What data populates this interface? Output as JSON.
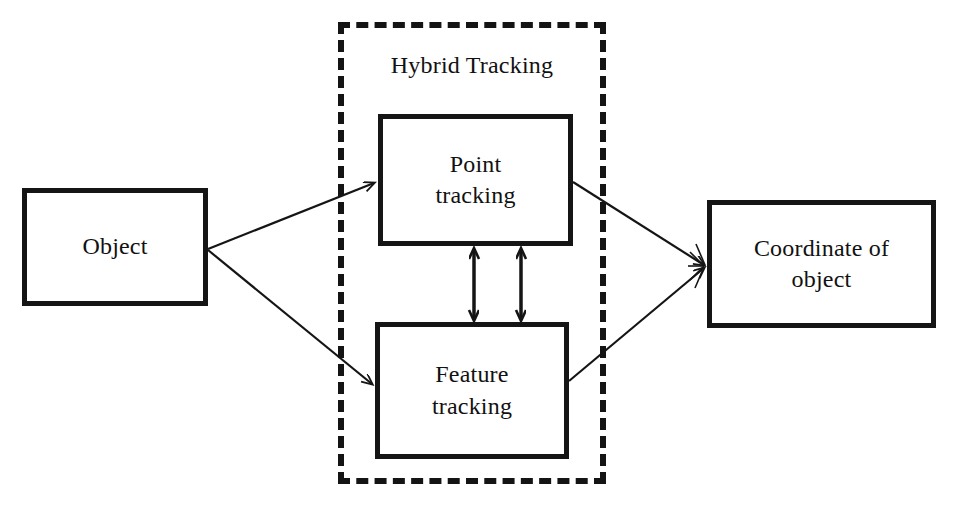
{
  "diagram": {
    "title": "Hybrid Tracking",
    "group": {
      "label": "Hybrid Tracking",
      "style": "dashed",
      "color": "#141414"
    },
    "nodes": [
      {
        "id": "object",
        "label": "Object"
      },
      {
        "id": "point",
        "label": "Point\ntracking"
      },
      {
        "id": "feature",
        "label": "Feature\ntracking"
      },
      {
        "id": "coordinate",
        "label": "Coordinate of\nobject"
      }
    ],
    "edges": [
      {
        "from": "object",
        "to": "point",
        "arrow": "single"
      },
      {
        "from": "object",
        "to": "feature",
        "arrow": "single"
      },
      {
        "from": "point",
        "to": "coordinate",
        "arrow": "single"
      },
      {
        "from": "feature",
        "to": "coordinate",
        "arrow": "single"
      },
      {
        "from": "point",
        "to": "feature",
        "arrow": "double"
      },
      {
        "from": "feature",
        "to": "point",
        "arrow": "double"
      }
    ],
    "colors": {
      "stroke": "#151515",
      "background": "#ffffff",
      "text": "#111111"
    }
  }
}
